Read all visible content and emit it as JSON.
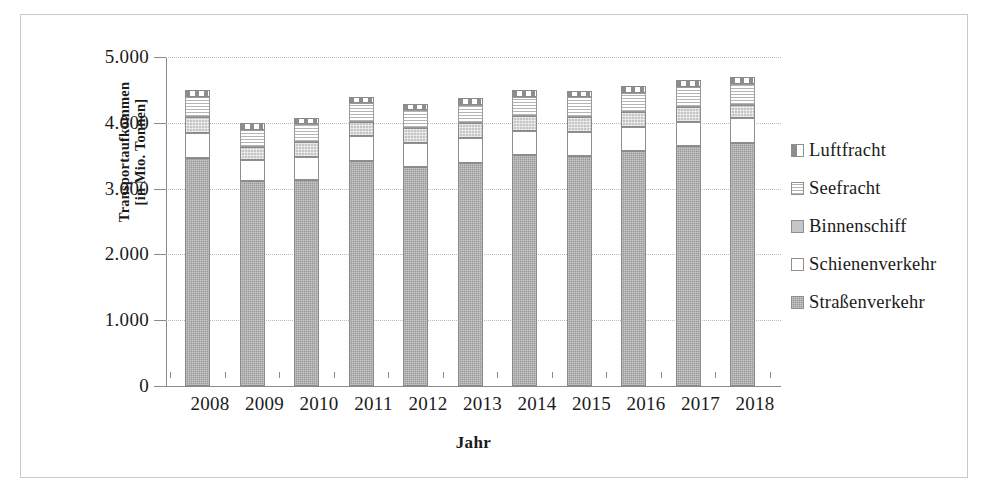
{
  "chart_data": {
    "type": "bar",
    "subtype": "stacked-vertical",
    "title": "",
    "xlabel": "Jahr",
    "ylabel": "Transportaufkommen [in Mio. Tonnen]",
    "ylabel_line1": "Transportaufkommen",
    "ylabel_line2": "[in Mio. Tonnen]",
    "categories": [
      "2008",
      "2009",
      "2010",
      "2011",
      "2012",
      "2013",
      "2014",
      "2015",
      "2016",
      "2017",
      "2018"
    ],
    "ylim": [
      0,
      5000
    ],
    "yticks": [
      0,
      1000,
      2000,
      3000,
      4000,
      5000
    ],
    "ytick_labels": [
      "0",
      "1.000",
      "2.000",
      "3.000",
      "4.000",
      "5.000"
    ],
    "grid": true,
    "legend_position": "right",
    "series": [
      {
        "name": "Straßenverkehr",
        "color": "#999999",
        "pattern": "fine-grid-gray",
        "values": [
          3470,
          3120,
          3125,
          3420,
          3325,
          3395,
          3510,
          3500,
          3575,
          3650,
          3690
        ]
      },
      {
        "name": "Schienenverkehr",
        "color": "#ffffff",
        "pattern": "solid-white",
        "values": [
          370,
          310,
          355,
          375,
          370,
          374,
          365,
          367,
          364,
          363,
          384
        ]
      },
      {
        "name": "Binnenschiff",
        "color": "#c6c6c6",
        "pattern": "light-checker",
        "values": [
          246,
          204,
          230,
          222,
          223,
          227,
          229,
          221,
          221,
          223,
          198
        ]
      },
      {
        "name": "Seefracht",
        "color": "#ffffff",
        "pattern": "horizontal-lines",
        "values": [
          300,
          255,
          270,
          285,
          270,
          280,
          295,
          297,
          300,
          310,
          315
        ]
      },
      {
        "name": "Luftfracht",
        "color": "#ffffff",
        "pattern": "half-dark-blocks",
        "values": [
          114,
          101,
          90,
          98,
          92,
          94,
          101,
          95,
          100,
          104,
          103
        ]
      }
    ],
    "stack_totals": [
      4500,
      3990,
      4070,
      4400,
      4280,
      4370,
      4500,
      4480,
      4560,
      4650,
      4690
    ]
  },
  "legend": {
    "items": [
      {
        "label": "Luftfracht",
        "swatch": "air-freight-swatch"
      },
      {
        "label": "Seefracht",
        "swatch": "sea-freight-swatch"
      },
      {
        "label": "Binnenschiff",
        "swatch": "inland-vessel-swatch"
      },
      {
        "label": "Schienenverkehr",
        "swatch": "rail-transport-swatch"
      },
      {
        "label": "Straßenverkehr",
        "swatch": "road-transport-swatch"
      }
    ]
  }
}
